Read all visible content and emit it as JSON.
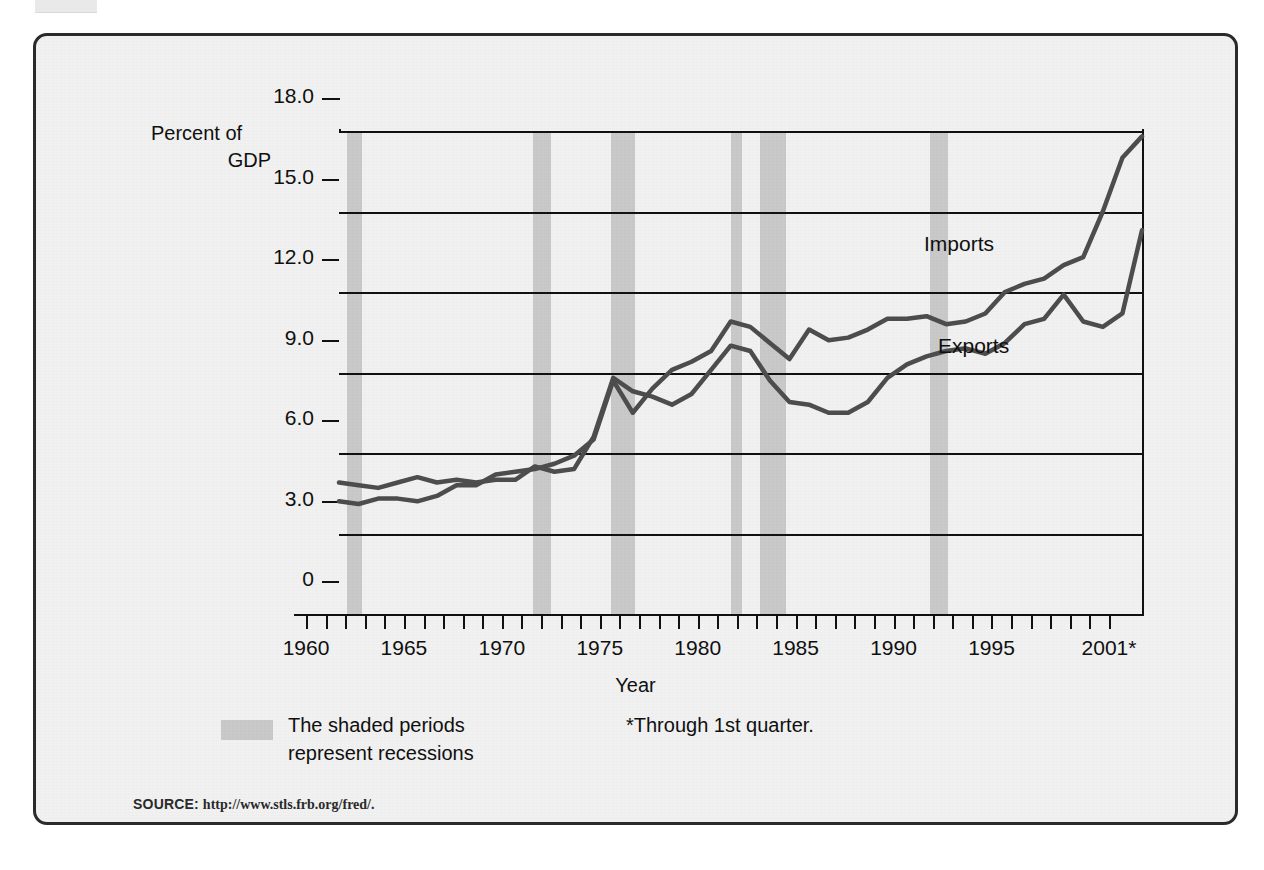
{
  "figure": {
    "axis_title_y_line1": "Percent of",
    "axis_title_y_line2": "GDP",
    "axis_title_x": "Year",
    "footnote": "*Through 1st quarter.",
    "legend_line1": "The shaded periods",
    "legend_line2": "represent recessions",
    "source_label": "SOURCE:",
    "source_url": "http://www.stls.frb.org/fred/.",
    "colors": {
      "line": "#4d4d4d",
      "recession_band": "#c9c9c9",
      "background": "#f1f1f1",
      "frame": "#2b2b2b",
      "axis": "#111111"
    }
  },
  "chart_data": {
    "type": "line",
    "title": "",
    "subtitle": "",
    "xlabel": "Year",
    "ylabel": "Percent of GDP",
    "xlim": [
      1960,
      2001
    ],
    "ylim": [
      0,
      18
    ],
    "grid": true,
    "legend_position": "inline-annotation",
    "ytick_labels": [
      "0",
      "3.0",
      "6.0",
      "9.0",
      "12.0",
      "15.0",
      "18.0"
    ],
    "ytick_values": [
      0,
      3,
      6,
      9,
      12,
      15,
      18
    ],
    "xtick_labels": [
      "1960",
      "1965",
      "1970",
      "1975",
      "1980",
      "1985",
      "1990",
      "1995",
      "2001*"
    ],
    "xtick_values": [
      1960,
      1965,
      1970,
      1975,
      1980,
      1985,
      1990,
      1995,
      2001
    ],
    "x": [
      1960,
      1961,
      1962,
      1963,
      1964,
      1965,
      1966,
      1967,
      1968,
      1969,
      1970,
      1971,
      1972,
      1973,
      1974,
      1975,
      1976,
      1977,
      1978,
      1979,
      1980,
      1981,
      1982,
      1983,
      1984,
      1985,
      1986,
      1987,
      1988,
      1989,
      1990,
      1991,
      1992,
      1993,
      1994,
      1995,
      1996,
      1997,
      1998,
      1999,
      2000,
      2001
    ],
    "series": [
      {
        "name": "Exports",
        "label": "Exports",
        "values": [
          4.9,
          4.8,
          4.7,
          4.9,
          5.1,
          4.9,
          5.0,
          4.9,
          5.0,
          5.0,
          5.5,
          5.3,
          5.4,
          6.6,
          8.8,
          8.3,
          8.1,
          7.8,
          8.2,
          9.1,
          10.0,
          9.8,
          8.7,
          7.9,
          7.8,
          7.5,
          7.5,
          7.9,
          8.8,
          9.3,
          9.6,
          9.8,
          9.9,
          9.7,
          10.1,
          10.8,
          11.0,
          11.9,
          10.9,
          10.7,
          11.2,
          14.3
        ]
      },
      {
        "name": "Imports",
        "label": "Imports",
        "values": [
          4.2,
          4.1,
          4.3,
          4.3,
          4.2,
          4.4,
          4.8,
          4.8,
          5.2,
          5.3,
          5.4,
          5.6,
          5.9,
          6.5,
          8.7,
          7.5,
          8.4,
          9.1,
          9.4,
          9.8,
          10.9,
          10.7,
          10.1,
          9.5,
          10.6,
          10.2,
          10.3,
          10.6,
          11.0,
          11.0,
          11.1,
          10.8,
          10.9,
          11.2,
          12.0,
          12.3,
          12.5,
          13.0,
          13.3,
          15.0,
          17.0,
          17.8
        ]
      }
    ],
    "recessions": [
      {
        "start": 1960.4,
        "end": 1961.2
      },
      {
        "start": 1969.9,
        "end": 1970.8
      },
      {
        "start": 1973.9,
        "end": 1975.1
      },
      {
        "start": 1980.0,
        "end": 1980.6
      },
      {
        "start": 1981.5,
        "end": 1982.8
      },
      {
        "start": 1990.2,
        "end": 1991.1
      }
    ]
  }
}
